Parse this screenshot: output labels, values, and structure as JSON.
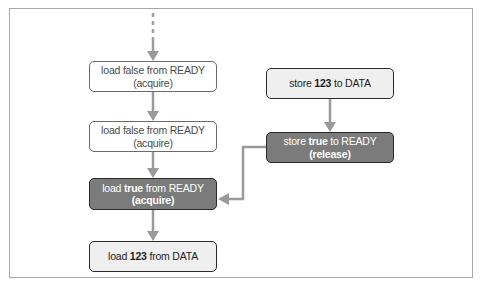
{
  "diagram": {
    "left_column": [
      {
        "id": "l1",
        "pre": "load false from READY",
        "bold": "",
        "post": "",
        "line2": "(acquire)",
        "line2_bold": false,
        "style": "outline"
      },
      {
        "id": "l2",
        "pre": "load false from READY",
        "bold": "",
        "post": "",
        "line2": "(acquire)",
        "line2_bold": false,
        "style": "outline"
      },
      {
        "id": "l3",
        "pre": "load ",
        "bold": "true",
        "post": " from READY",
        "line2": "(acquire)",
        "line2_bold": true,
        "style": "dark"
      },
      {
        "id": "l4",
        "pre": "load ",
        "bold": "123",
        "post": " from DATA",
        "line2": "",
        "line2_bold": false,
        "style": "light"
      }
    ],
    "right_column": [
      {
        "id": "r1",
        "pre": "store ",
        "bold": "123",
        "post": " to DATA",
        "line2": "",
        "line2_bold": false,
        "style": "light"
      },
      {
        "id": "r2",
        "pre": "store ",
        "bold": "true",
        "post": " to READY",
        "line2": "(release)",
        "line2_bold": true,
        "style": "dark"
      }
    ],
    "edges": [
      {
        "from": "start",
        "to": "l1",
        "style": "dashed-then-solid"
      },
      {
        "from": "l1",
        "to": "l2"
      },
      {
        "from": "l2",
        "to": "l3"
      },
      {
        "from": "l3",
        "to": "l4"
      },
      {
        "from": "r1",
        "to": "r2"
      },
      {
        "from": "r2",
        "to": "l3",
        "label": "happens-before"
      }
    ],
    "colors": {
      "arrow": "#9a9a9a",
      "dark_box": "#7b7b7b",
      "light_box": "#efefef",
      "border": "#2a2a2a"
    }
  }
}
